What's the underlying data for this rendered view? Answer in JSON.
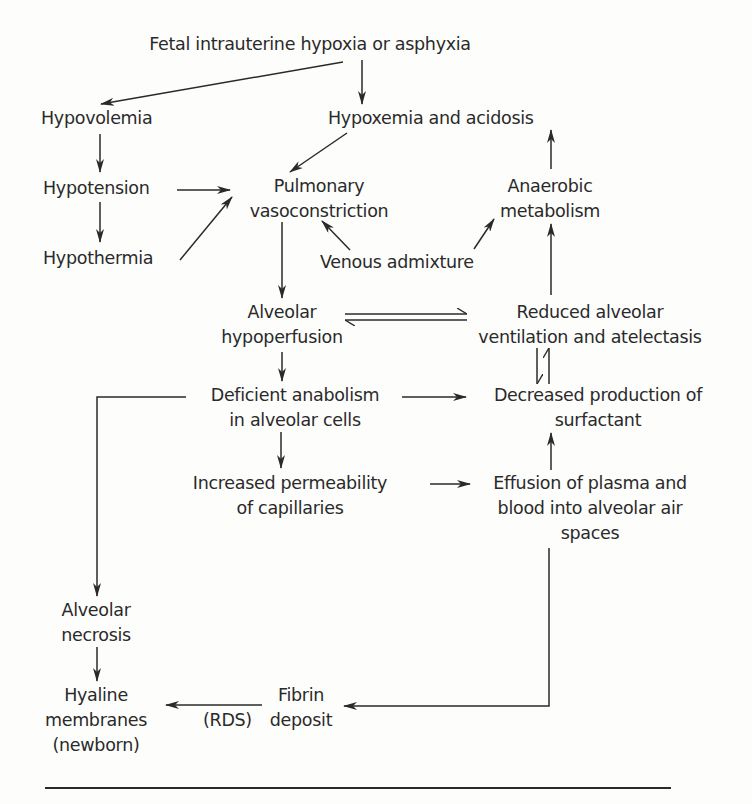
{
  "diagram": {
    "type": "flowchart",
    "topic": "Pathogenesis of hyaline membrane disease (RDS) in the newborn",
    "nodes": {
      "fetal_hypoxia": {
        "lines": [
          "Fetal intrauterine hypoxia or asphyxia"
        ]
      },
      "hypovolemia": {
        "lines": [
          "Hypovolemia"
        ]
      },
      "hypoxemia": {
        "lines": [
          "Hypoxemia and acidosis"
        ]
      },
      "hypotension": {
        "lines": [
          "Hypotension"
        ]
      },
      "pulmonary_vasoconstriction": {
        "lines": [
          "Pulmonary",
          "vasoconstriction"
        ]
      },
      "anaerobic_metabolism": {
        "lines": [
          "Anaerobic",
          "metabolism"
        ]
      },
      "hypothermia": {
        "lines": [
          "Hypothermia"
        ]
      },
      "venous_admixture": {
        "lines": [
          "Venous admixture"
        ]
      },
      "alveolar_hypoperfusion": {
        "lines": [
          "Alveolar",
          "hypoperfusion"
        ]
      },
      "reduced_ventilation": {
        "lines": [
          "Reduced alveolar",
          "ventilation and atelectasis"
        ]
      },
      "deficient_anabolism": {
        "lines": [
          "Deficient anabolism",
          "in alveolar cells"
        ]
      },
      "decreased_surfactant": {
        "lines": [
          "Decreased production of",
          "surfactant"
        ]
      },
      "increased_permeability": {
        "lines": [
          "Increased permeability",
          "of capillaries"
        ]
      },
      "effusion": {
        "lines": [
          "Effusion of plasma and",
          "blood into alveolar air",
          "spaces"
        ]
      },
      "alveolar_necrosis": {
        "lines": [
          "Alveolar",
          "necrosis"
        ]
      },
      "hyaline_membranes": {
        "lines": [
          "Hyaline",
          "membranes",
          "(newborn)"
        ]
      },
      "fibrin_deposit": {
        "lines": [
          "Fibrin",
          "deposit"
        ]
      }
    },
    "edge_labels": {
      "rds": "(RDS)"
    },
    "edges": [
      {
        "from": "fetal_hypoxia",
        "to": "hypovolemia"
      },
      {
        "from": "fetal_hypoxia",
        "to": "hypoxemia"
      },
      {
        "from": "hypovolemia",
        "to": "hypotension"
      },
      {
        "from": "hypotension",
        "to": "hypothermia"
      },
      {
        "from": "hypoxemia",
        "to": "pulmonary_vasoconstriction"
      },
      {
        "from": "hypotension",
        "to": "pulmonary_vasoconstriction"
      },
      {
        "from": "hypothermia",
        "to": "pulmonary_vasoconstriction"
      },
      {
        "from": "venous_admixture",
        "to": "pulmonary_vasoconstriction"
      },
      {
        "from": "venous_admixture",
        "to": "anaerobic_metabolism"
      },
      {
        "from": "anaerobic_metabolism",
        "to": "hypoxemia"
      },
      {
        "from": "reduced_ventilation",
        "to": "anaerobic_metabolism"
      },
      {
        "from": "pulmonary_vasoconstriction",
        "to": "alveolar_hypoperfusion"
      },
      {
        "from": "alveolar_hypoperfusion",
        "to": "reduced_ventilation",
        "bidirectional": true
      },
      {
        "from": "reduced_ventilation",
        "to": "decreased_surfactant",
        "bidirectional": true
      },
      {
        "from": "alveolar_hypoperfusion",
        "to": "deficient_anabolism"
      },
      {
        "from": "deficient_anabolism",
        "to": "decreased_surfactant"
      },
      {
        "from": "deficient_anabolism",
        "to": "increased_permeability"
      },
      {
        "from": "deficient_anabolism",
        "to": "alveolar_necrosis"
      },
      {
        "from": "increased_permeability",
        "to": "effusion"
      },
      {
        "from": "effusion",
        "to": "decreased_surfactant"
      },
      {
        "from": "effusion",
        "to": "fibrin_deposit"
      },
      {
        "from": "alveolar_necrosis",
        "to": "hyaline_membranes"
      },
      {
        "from": "fibrin_deposit",
        "to": "hyaline_membranes",
        "label": "(RDS)"
      }
    ]
  },
  "colors": {
    "ink": "#2a2a2a",
    "background": "#fdfdfc"
  }
}
